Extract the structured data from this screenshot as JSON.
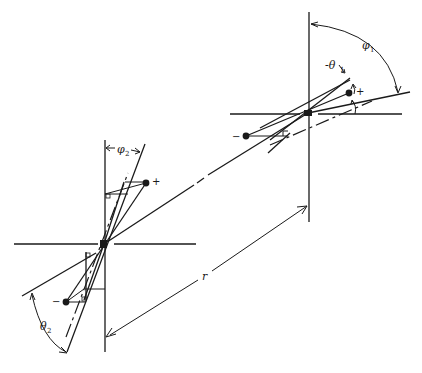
{
  "diagram": {
    "type": "dipole-dipole geometry",
    "labels": {
      "phi1": "φ",
      "phi1_sub": "1",
      "theta1": "-θ",
      "theta1_sub": "1",
      "phi2": "φ",
      "phi2_sub": "2",
      "theta2": "θ",
      "theta2_sub": "2",
      "r": "r",
      "plus": "+",
      "minus": "−"
    },
    "dipole_1": {
      "origin": [
        308,
        113
      ],
      "plus_charge": [
        349,
        93
      ],
      "minus_charge": [
        246,
        136
      ]
    },
    "dipole_2": {
      "origin": [
        104,
        244
      ],
      "plus_charge": [
        146,
        183
      ],
      "minus_charge": [
        66,
        302
      ]
    },
    "colors": {
      "ink": "#1a1a1a",
      "background": "#ffffff"
    }
  }
}
